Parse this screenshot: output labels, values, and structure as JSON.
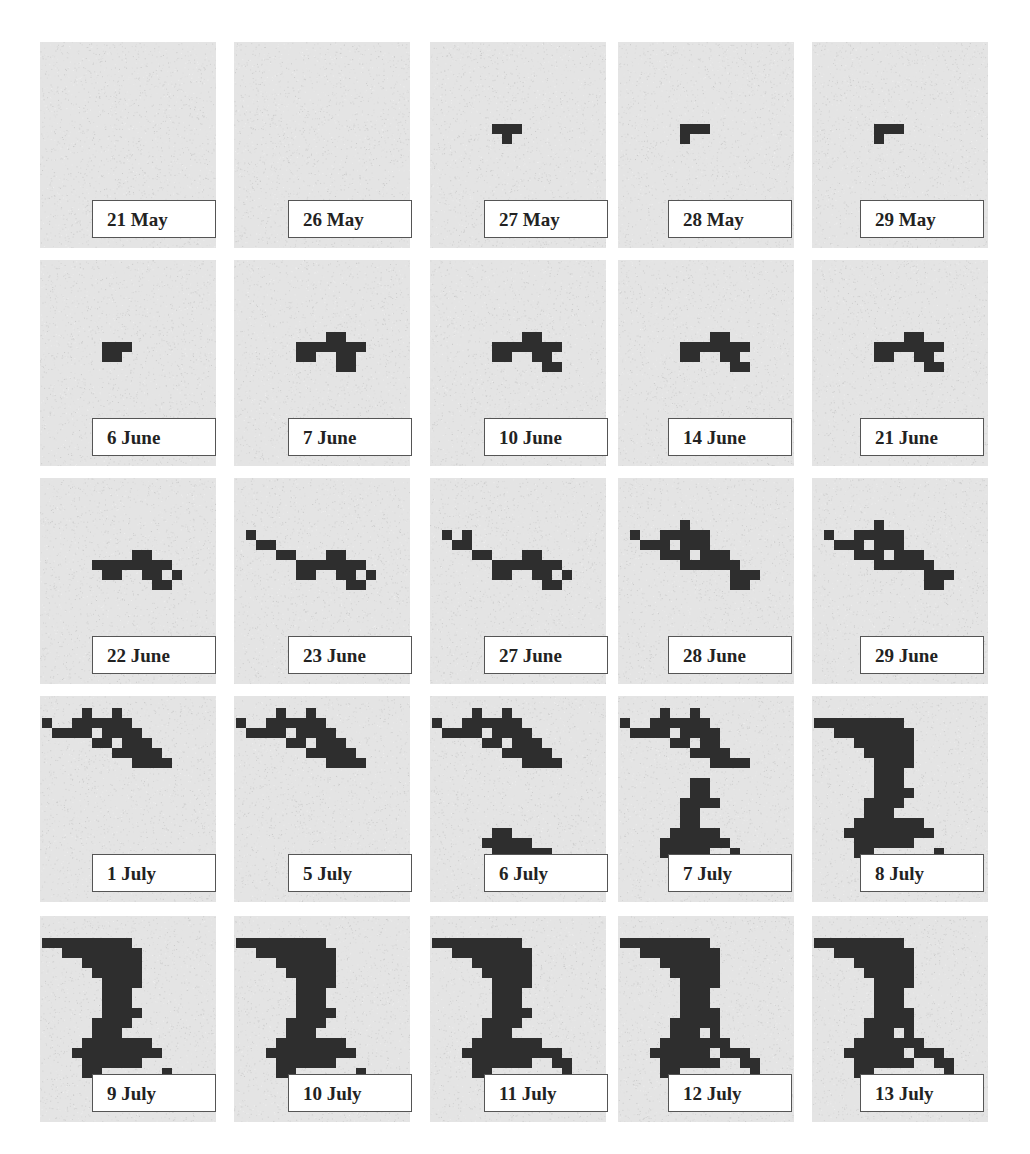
{
  "figure": {
    "panels": [
      {
        "label": "21 May",
        "cells": []
      },
      {
        "label": "26 May",
        "cells": []
      },
      {
        "label": "27 May",
        "cells": [
          "6,8",
          "7,8",
          "8,8",
          "7,9"
        ]
      },
      {
        "label": "28 May",
        "cells": [
          "6,8",
          "7,8",
          "8,8",
          "6,9"
        ]
      },
      {
        "label": "29 May",
        "cells": [
          "6,8",
          "7,8",
          "8,8",
          "6,9"
        ]
      },
      {
        "label": "6 June",
        "cells": [
          "6,8",
          "7,8",
          "8,8",
          "6,9",
          "7,9"
        ]
      },
      {
        "label": "7 June",
        "cells": [
          "6,8",
          "7,8",
          "8,8",
          "9,7",
          "10,7",
          "9,8",
          "10,8",
          "11,8",
          "12,8",
          "6,9",
          "7,9",
          "10,9",
          "11,9",
          "10,10",
          "11,10"
        ]
      },
      {
        "label": "10 June",
        "cells": [
          "6,8",
          "7,8",
          "8,8",
          "9,7",
          "10,7",
          "9,8",
          "10,8",
          "11,8",
          "12,8",
          "6,9",
          "7,9",
          "10,9",
          "11,9",
          "11,10",
          "12,10"
        ]
      },
      {
        "label": "14 June",
        "cells": [
          "6,8",
          "7,8",
          "8,8",
          "9,7",
          "10,7",
          "9,8",
          "10,8",
          "11,8",
          "12,8",
          "6,9",
          "7,9",
          "10,9",
          "11,9",
          "11,10",
          "12,10"
        ]
      },
      {
        "label": "21 June",
        "cells": [
          "6,8",
          "7,8",
          "8,8",
          "9,7",
          "10,7",
          "9,8",
          "10,8",
          "11,8",
          "12,8",
          "6,9",
          "7,9",
          "10,9",
          "11,9",
          "11,10",
          "12,10"
        ]
      },
      {
        "label": "22 June",
        "cells": [
          "5,8",
          "6,8",
          "7,8",
          "8,8",
          "9,7",
          "10,7",
          "9,8",
          "10,8",
          "11,8",
          "12,8",
          "6,9",
          "7,9",
          "10,9",
          "11,9",
          "11,10",
          "12,10",
          "13,9"
        ]
      },
      {
        "label": "23 June",
        "cells": [
          "1,5",
          "2,6",
          "3,6",
          "4,7",
          "5,7",
          "6,8",
          "7,8",
          "8,8",
          "9,7",
          "10,7",
          "9,8",
          "10,8",
          "11,8",
          "12,8",
          "6,9",
          "7,9",
          "10,9",
          "11,9",
          "11,10",
          "12,10",
          "13,9"
        ]
      },
      {
        "label": "27 June",
        "cells": [
          "1,5",
          "2,6",
          "3,5",
          "3,6",
          "4,7",
          "5,7",
          "6,8",
          "7,8",
          "8,8",
          "9,7",
          "10,7",
          "9,8",
          "10,8",
          "11,8",
          "12,8",
          "6,9",
          "7,9",
          "10,9",
          "11,9",
          "11,10",
          "12,10",
          "13,9"
        ]
      },
      {
        "label": "28 June",
        "cells": [
          "1,5",
          "2,6",
          "3,6",
          "4,5",
          "4,6",
          "4,7",
          "5,5",
          "5,7",
          "6,4",
          "6,5",
          "6,6",
          "6,7",
          "6,8",
          "7,5",
          "7,6",
          "7,8",
          "8,5",
          "8,6",
          "8,7",
          "8,8",
          "9,7",
          "10,7",
          "9,8",
          "10,8",
          "11,8",
          "11,9",
          "12,9",
          "12,10",
          "11,10",
          "13,9"
        ]
      },
      {
        "label": "29 June",
        "cells": [
          "1,5",
          "2,6",
          "3,6",
          "4,5",
          "4,6",
          "4,7",
          "5,5",
          "5,7",
          "6,4",
          "6,5",
          "6,6",
          "6,7",
          "6,8",
          "7,5",
          "7,6",
          "7,8",
          "8,5",
          "8,6",
          "8,7",
          "8,8",
          "9,7",
          "10,7",
          "9,8",
          "10,8",
          "11,8",
          "11,9",
          "12,9",
          "12,10",
          "11,10",
          "13,9"
        ]
      },
      {
        "label": "1 July",
        "cells": [
          "0,2",
          "1,3",
          "2,3",
          "3,2",
          "3,3",
          "4,1",
          "4,2",
          "4,3",
          "5,2",
          "5,4",
          "6,2",
          "6,3",
          "6,4",
          "7,1",
          "7,2",
          "7,3",
          "7,5",
          "8,2",
          "8,3",
          "8,4",
          "8,5",
          "9,3",
          "9,4",
          "9,5",
          "9,6",
          "10,4",
          "10,5",
          "10,6",
          "11,5",
          "11,6",
          "12,6"
        ]
      },
      {
        "label": "5 July",
        "cells": [
          "0,2",
          "1,3",
          "2,3",
          "3,2",
          "3,3",
          "4,1",
          "4,2",
          "4,3",
          "5,2",
          "5,4",
          "6,2",
          "6,3",
          "6,4",
          "7,1",
          "7,2",
          "7,3",
          "7,5",
          "8,2",
          "8,3",
          "8,4",
          "8,5",
          "9,3",
          "9,4",
          "9,5",
          "9,6",
          "10,4",
          "10,5",
          "10,6",
          "11,5",
          "11,6",
          "12,6"
        ]
      },
      {
        "label": "6 July",
        "cells": [
          "0,2",
          "1,3",
          "2,3",
          "3,2",
          "3,3",
          "4,1",
          "4,2",
          "4,3",
          "5,2",
          "5,4",
          "6,2",
          "6,3",
          "6,4",
          "7,1",
          "7,2",
          "7,3",
          "7,5",
          "8,2",
          "8,3",
          "8,4",
          "8,5",
          "9,3",
          "9,4",
          "9,5",
          "9,6",
          "10,4",
          "10,5",
          "10,6",
          "11,5",
          "11,6",
          "12,6",
          "5,14",
          "6,13",
          "6,14",
          "6,15",
          "7,13",
          "7,14",
          "7,15",
          "8,14",
          "8,15",
          "9,14",
          "9,15",
          "10,15",
          "11,15",
          "11,16",
          "12,16"
        ]
      },
      {
        "label": "7 July",
        "cells": [
          "0,2",
          "1,3",
          "2,3",
          "3,2",
          "3,3",
          "4,1",
          "4,2",
          "4,3",
          "5,2",
          "5,4",
          "6,2",
          "6,3",
          "6,4",
          "7,1",
          "7,2",
          "7,3",
          "7,5",
          "8,2",
          "8,3",
          "8,4",
          "8,5",
          "9,3",
          "9,4",
          "9,5",
          "9,6",
          "10,5",
          "10,6",
          "11,6",
          "12,6",
          "7,8",
          "8,8",
          "8,9",
          "7,9",
          "6,10",
          "7,10",
          "8,10",
          "9,10",
          "6,11",
          "7,11",
          "6,12",
          "7,12",
          "5,13",
          "6,13",
          "7,13",
          "8,13",
          "9,13",
          "4,14",
          "5,14",
          "6,14",
          "7,14",
          "8,14",
          "9,14",
          "10,14",
          "4,15",
          "5,15",
          "6,15",
          "7,15",
          "8,15",
          "11,15",
          "12,16"
        ]
      },
      {
        "label": "8 July",
        "cells": [
          "0,2",
          "1,2",
          "2,2",
          "2,3",
          "3,2",
          "3,3",
          "4,2",
          "4,3",
          "5,2",
          "5,3",
          "6,2",
          "6,3",
          "7,2",
          "7,3",
          "8,2",
          "8,3",
          "9,3",
          "4,4",
          "5,4",
          "6,4",
          "7,4",
          "8,4",
          "9,4",
          "5,5",
          "6,5",
          "7,5",
          "8,5",
          "9,5",
          "6,6",
          "7,6",
          "8,6",
          "9,6",
          "6,7",
          "7,7",
          "8,7",
          "6,8",
          "7,8",
          "8,8",
          "6,9",
          "7,9",
          "8,9",
          "9,9",
          "5,10",
          "6,10",
          "7,10",
          "8,10",
          "5,11",
          "6,11",
          "7,11",
          "4,12",
          "5,12",
          "6,12",
          "7,12",
          "8,12",
          "9,12",
          "10,12",
          "3,13",
          "4,13",
          "5,13",
          "6,13",
          "7,13",
          "8,13",
          "9,13",
          "10,13",
          "11,13",
          "4,14",
          "5,14",
          "6,14",
          "7,14",
          "8,14",
          "9,14",
          "4,15",
          "5,15",
          "12,15"
        ]
      },
      {
        "label": "9 July",
        "cells": [
          "0,2",
          "1,2",
          "2,2",
          "2,3",
          "3,2",
          "3,3",
          "4,2",
          "4,3",
          "5,2",
          "5,3",
          "6,2",
          "6,3",
          "7,2",
          "7,3",
          "8,2",
          "8,3",
          "9,3",
          "4,4",
          "5,4",
          "6,4",
          "7,4",
          "8,4",
          "9,4",
          "5,5",
          "6,5",
          "7,5",
          "8,5",
          "9,5",
          "6,6",
          "7,6",
          "8,6",
          "9,6",
          "6,7",
          "7,7",
          "8,7",
          "6,8",
          "7,8",
          "8,8",
          "6,9",
          "7,9",
          "8,9",
          "9,9",
          "5,10",
          "6,10",
          "7,10",
          "8,10",
          "5,11",
          "6,11",
          "7,11",
          "4,12",
          "5,12",
          "6,12",
          "7,12",
          "8,12",
          "9,12",
          "10,12",
          "3,13",
          "4,13",
          "5,13",
          "6,13",
          "7,13",
          "8,13",
          "9,13",
          "10,13",
          "11,13",
          "4,14",
          "5,14",
          "6,14",
          "7,14",
          "8,14",
          "9,14",
          "4,15",
          "5,15",
          "12,15",
          "13,16"
        ]
      },
      {
        "label": "10 July",
        "cells": [
          "0,2",
          "1,2",
          "2,2",
          "2,3",
          "3,2",
          "3,3",
          "4,2",
          "4,3",
          "5,2",
          "5,3",
          "6,2",
          "6,3",
          "7,2",
          "7,3",
          "8,2",
          "8,3",
          "9,3",
          "4,4",
          "5,4",
          "6,4",
          "7,4",
          "8,4",
          "9,4",
          "5,5",
          "6,5",
          "7,5",
          "8,5",
          "9,5",
          "6,6",
          "7,6",
          "8,6",
          "9,6",
          "6,7",
          "7,7",
          "8,7",
          "6,8",
          "7,8",
          "8,8",
          "6,9",
          "7,9",
          "8,9",
          "9,9",
          "5,10",
          "6,10",
          "7,10",
          "8,10",
          "5,11",
          "6,11",
          "7,11",
          "4,12",
          "5,12",
          "6,12",
          "7,12",
          "8,12",
          "9,12",
          "10,12",
          "3,13",
          "4,13",
          "5,13",
          "6,13",
          "7,13",
          "8,13",
          "9,13",
          "10,13",
          "11,13",
          "4,14",
          "5,14",
          "6,14",
          "7,14",
          "8,14",
          "9,14",
          "4,15",
          "5,15",
          "12,15",
          "13,16"
        ]
      },
      {
        "label": "11 July",
        "cells": [
          "0,2",
          "1,2",
          "2,2",
          "2,3",
          "3,2",
          "3,3",
          "4,2",
          "4,3",
          "5,2",
          "5,3",
          "6,2",
          "6,3",
          "7,2",
          "7,3",
          "8,2",
          "8,3",
          "9,3",
          "4,4",
          "5,4",
          "6,4",
          "7,4",
          "8,4",
          "9,4",
          "5,5",
          "6,5",
          "7,5",
          "8,5",
          "9,5",
          "6,6",
          "7,6",
          "8,6",
          "9,6",
          "6,7",
          "7,7",
          "8,7",
          "6,8",
          "7,8",
          "8,8",
          "6,9",
          "7,9",
          "8,9",
          "9,9",
          "5,10",
          "6,10",
          "7,10",
          "8,10",
          "5,11",
          "6,11",
          "7,11",
          "4,12",
          "5,12",
          "6,12",
          "7,12",
          "8,12",
          "9,12",
          "10,12",
          "3,13",
          "4,13",
          "5,13",
          "6,13",
          "7,13",
          "8,13",
          "9,13",
          "10,13",
          "11,13",
          "12,13",
          "4,14",
          "5,14",
          "6,14",
          "7,14",
          "8,14",
          "9,14",
          "12,14",
          "13,14",
          "4,15",
          "5,15",
          "13,15"
        ]
      },
      {
        "label": "12 July",
        "cells": [
          "0,2",
          "1,2",
          "2,2",
          "2,3",
          "3,2",
          "3,3",
          "4,2",
          "4,3",
          "5,2",
          "5,3",
          "6,2",
          "6,3",
          "7,2",
          "7,3",
          "8,2",
          "8,3",
          "9,3",
          "4,4",
          "5,4",
          "6,4",
          "7,4",
          "8,4",
          "9,4",
          "5,5",
          "6,5",
          "7,5",
          "8,5",
          "9,5",
          "6,6",
          "7,6",
          "8,6",
          "9,6",
          "6,7",
          "7,7",
          "8,7",
          "6,8",
          "7,8",
          "8,8",
          "6,9",
          "7,9",
          "8,9",
          "9,9",
          "5,10",
          "6,10",
          "7,10",
          "8,10",
          "9,10",
          "5,11",
          "6,11",
          "7,11",
          "9,11",
          "4,12",
          "5,12",
          "6,12",
          "7,12",
          "8,12",
          "9,12",
          "10,12",
          "3,13",
          "4,13",
          "5,13",
          "6,13",
          "7,13",
          "8,13",
          "10,13",
          "11,13",
          "12,13",
          "4,14",
          "5,14",
          "6,14",
          "7,14",
          "8,14",
          "9,14",
          "12,14",
          "13,14",
          "4,15",
          "5,15",
          "13,15"
        ]
      },
      {
        "label": "13 July",
        "cells": [
          "0,2",
          "1,2",
          "2,2",
          "2,3",
          "3,2",
          "3,3",
          "4,2",
          "4,3",
          "5,2",
          "5,3",
          "6,2",
          "6,3",
          "7,2",
          "7,3",
          "8,2",
          "8,3",
          "9,3",
          "4,4",
          "5,4",
          "6,4",
          "7,4",
          "8,4",
          "9,4",
          "5,5",
          "6,5",
          "7,5",
          "8,5",
          "9,5",
          "6,6",
          "7,6",
          "8,6",
          "9,6",
          "6,7",
          "7,7",
          "8,7",
          "6,8",
          "7,8",
          "8,8",
          "6,9",
          "7,9",
          "8,9",
          "9,9",
          "5,10",
          "6,10",
          "7,10",
          "8,10",
          "9,10",
          "5,11",
          "6,11",
          "7,11",
          "9,11",
          "4,12",
          "5,12",
          "6,12",
          "7,12",
          "8,12",
          "9,12",
          "10,12",
          "3,13",
          "4,13",
          "5,13",
          "6,13",
          "7,13",
          "8,13",
          "10,13",
          "11,13",
          "12,13",
          "4,14",
          "5,14",
          "6,14",
          "7,14",
          "8,14",
          "9,14",
          "12,14",
          "13,14",
          "4,15",
          "5,15",
          "13,15"
        ]
      }
    ]
  },
  "colors": {
    "panel_bg": "#e4e4e4",
    "cell": "#2e2e2e",
    "label_border": "#555555"
  }
}
